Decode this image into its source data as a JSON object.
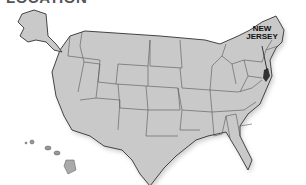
{
  "title": "LOCATION",
  "map": {
    "region": "United States",
    "highlighted_state": "New Jersey",
    "label_line1": "NEW",
    "label_line2": "JERSEY",
    "colors": {
      "state_fill": "#c9c9c9",
      "border": "#555555",
      "highlight": "#333333",
      "background": "#ffffff"
    }
  }
}
